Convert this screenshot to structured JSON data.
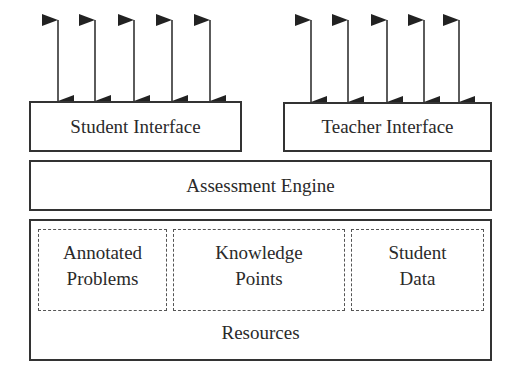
{
  "diagram": {
    "student_interface": {
      "label": "Student Interface",
      "arrow_x": [
        58,
        95,
        134,
        172,
        210
      ]
    },
    "teacher_interface": {
      "label": "Teacher Interface",
      "arrow_x": [
        311,
        348,
        387,
        424,
        459
      ]
    },
    "assessment_engine": {
      "label": "Assessment Engine"
    },
    "resources": {
      "label": "Resources",
      "components": [
        {
          "line1": "Annotated",
          "line2": "Problems"
        },
        {
          "line1": "Knowledge",
          "line2": "Points"
        },
        {
          "line1": "Student",
          "line2": "Data"
        }
      ]
    },
    "colors": {
      "line": "#333333",
      "dashed": "#555555",
      "text": "#2a2a2a",
      "background": "#ffffff"
    }
  }
}
